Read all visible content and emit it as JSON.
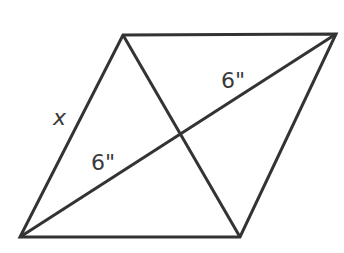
{
  "diagram": {
    "type": "parallelogram-with-diagonals",
    "stroke_color": "#333333",
    "background": "#ffffff",
    "vertices": {
      "top_left": [
        123,
        35
      ],
      "top_right": [
        336,
        34
      ],
      "bottom_right": [
        240,
        237
      ],
      "bottom_left": [
        20,
        237
      ]
    },
    "diagonal_intersection": [
      181,
      134
    ],
    "labels": {
      "side": "x",
      "diagonal_upper_segment": "6\"",
      "diagonal_lower_segment": "6\""
    }
  }
}
